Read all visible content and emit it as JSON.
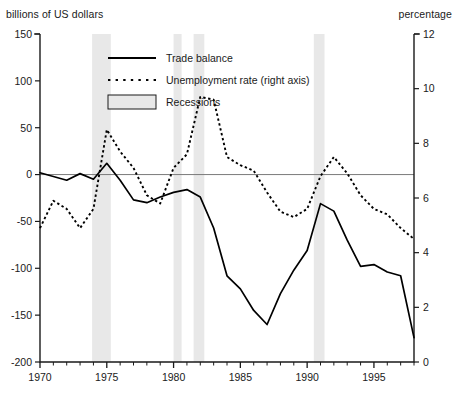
{
  "chart_data": {
    "type": "line",
    "title": "",
    "xlabel": "",
    "ylabel": "billions of US dollars",
    "y2label": "percentage",
    "xlim": [
      1970,
      1998
    ],
    "ylim": [
      -200,
      150
    ],
    "y2lim": [
      0,
      12
    ],
    "grid": false,
    "legend_position": "top-center",
    "y_ticks": [
      150,
      100,
      50,
      0,
      -50,
      -100,
      -150,
      -200
    ],
    "y2_ticks": [
      12,
      10,
      8,
      6,
      4,
      2,
      0
    ],
    "x_ticks": [
      1970,
      1975,
      1980,
      1985,
      1990,
      1995
    ],
    "x_minor_tick_step": 1,
    "series": [
      {
        "name": "Trade balance",
        "axis": "left",
        "style": "solid",
        "color": "#000000",
        "x": [
          1970,
          1971,
          1972,
          1973,
          1974,
          1975,
          1976,
          1977,
          1978,
          1979,
          1980,
          1981,
          1982,
          1983,
          1984,
          1985,
          1986,
          1987,
          1988,
          1989,
          1990,
          1991,
          1992,
          1993,
          1994,
          1995,
          1996,
          1997,
          1998
        ],
        "values": [
          2,
          -2,
          -6,
          1,
          -5,
          12,
          -6,
          -27,
          -30,
          -24,
          -19,
          -16,
          -24,
          -57,
          -108,
          -122,
          -145,
          -160,
          -127,
          -102,
          -81,
          -31,
          -39,
          -70,
          -98,
          -96,
          -104,
          -108,
          -174
        ]
      },
      {
        "name": "Unemployment rate (right axis)",
        "axis": "right",
        "style": "dotted",
        "color": "#000000",
        "x": [
          1970,
          1971,
          1972,
          1973,
          1974,
          1975,
          1976,
          1977,
          1978,
          1979,
          1980,
          1981,
          1982,
          1983,
          1984,
          1985,
          1986,
          1987,
          1988,
          1989,
          1990,
          1991,
          1992,
          1993,
          1994,
          1995,
          1996,
          1997,
          1998
        ],
        "values": [
          4.9,
          5.9,
          5.6,
          4.9,
          5.6,
          8.5,
          7.7,
          7.1,
          6.1,
          5.8,
          7.1,
          7.6,
          9.7,
          9.6,
          7.5,
          7.2,
          7.0,
          6.2,
          5.5,
          5.3,
          5.6,
          6.8,
          7.5,
          6.9,
          6.1,
          5.6,
          5.4,
          4.9,
          4.5
        ]
      }
    ],
    "shaded_regions": {
      "name": "Recessions",
      "color": "#e8e8e8",
      "spans": [
        [
          1973.9,
          1975.3
        ],
        [
          1980.0,
          1980.6
        ],
        [
          1981.5,
          1982.3
        ],
        [
          1990.5,
          1991.3
        ]
      ]
    },
    "legend": [
      {
        "label": "Trade balance",
        "marker": "solid-line"
      },
      {
        "label": "Unemployment rate (right axis)",
        "marker": "dotted-line"
      },
      {
        "label": "Recessions",
        "marker": "shaded-box"
      }
    ],
    "zero_line": 0
  }
}
